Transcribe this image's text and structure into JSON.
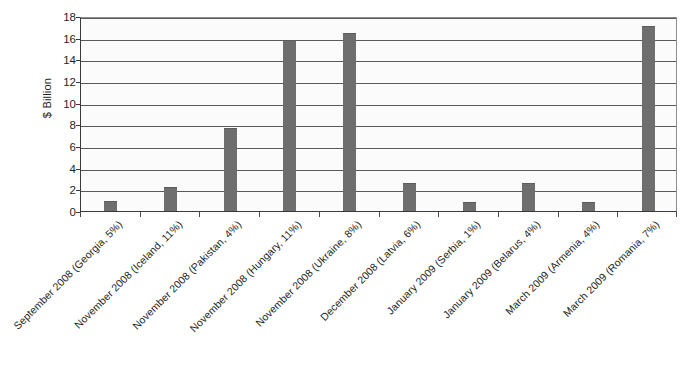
{
  "chart_data": {
    "type": "bar",
    "title": "",
    "subtitle": "",
    "xlabel": "",
    "ylabel": "$ Billion",
    "ylim": [
      0,
      18
    ],
    "ytick_step": 2,
    "yticks": [
      0,
      2,
      4,
      6,
      8,
      10,
      12,
      14,
      16,
      18
    ],
    "grid": true,
    "legend": false,
    "bar_color": "#6e6e6e",
    "plot_background": "#fbfbfb",
    "gridline_color": "#5a5a5a",
    "axis_color": "#3a3a3a",
    "categories": [
      "September 2008 (Georgia, 5%)",
      "November 2008 (Iceland, 11%)",
      "November 2008 (Pakistan, 4%)",
      "November 2008 (Hungary, 11%)",
      "November 2008 (Ukraine, 8%)",
      "December 2008 (Latvia, 6%)",
      "January 2009 (Serbia, 1%)",
      "January 2009 (Belarus, 4%)",
      "March 2009 (Armenia, 4%)",
      "March 2009 (Romania, 7%)"
    ],
    "values": [
      0.9,
      2.25,
      7.7,
      15.8,
      16.4,
      2.6,
      0.85,
      2.6,
      0.85,
      17.1
    ],
    "points": [
      {
        "category": "September 2008 (Georgia, 5%)",
        "country": "Georgia",
        "date": "September 2008",
        "percent": "5%",
        "value": 0.9
      },
      {
        "category": "November 2008 (Iceland, 11%)",
        "country": "Iceland",
        "date": "November 2008",
        "percent": "11%",
        "value": 2.25
      },
      {
        "category": "November 2008 (Pakistan, 4%)",
        "country": "Pakistan",
        "date": "November 2008",
        "percent": "4%",
        "value": 7.7
      },
      {
        "category": "November 2008 (Hungary, 11%)",
        "country": "Hungary",
        "date": "November 2008",
        "percent": "11%",
        "value": 15.8
      },
      {
        "category": "November 2008 (Ukraine, 8%)",
        "country": "Ukraine",
        "date": "November 2008",
        "percent": "8%",
        "value": 16.4
      },
      {
        "category": "December 2008 (Latvia, 6%)",
        "country": "Latvia",
        "date": "December 2008",
        "percent": "6%",
        "value": 2.6
      },
      {
        "category": "January 2009 (Serbia, 1%)",
        "country": "Serbia",
        "date": "January 2009",
        "percent": "1%",
        "value": 0.85
      },
      {
        "category": "January 2009 (Belarus, 4%)",
        "country": "Belarus",
        "date": "January 2009",
        "percent": "4%",
        "value": 2.6
      },
      {
        "category": "March 2009 (Armenia, 4%)",
        "country": "Armenia",
        "date": "March 2009",
        "percent": "4%",
        "value": 0.85
      },
      {
        "category": "March 2009 (Romania, 7%)",
        "country": "Romania",
        "date": "March 2009",
        "percent": "7%",
        "value": 17.1
      }
    ]
  }
}
